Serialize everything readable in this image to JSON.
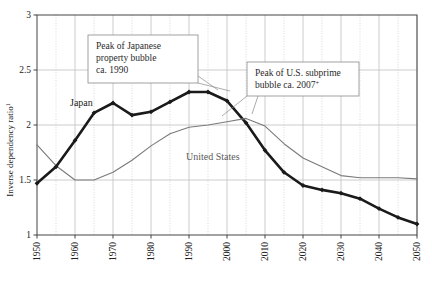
{
  "chart_data": {
    "type": "line",
    "title": "",
    "xlabel": "",
    "ylabel": "Inverse dependency ratio",
    "ylabel_superscript": "1",
    "xlim": [
      1950,
      2050
    ],
    "ylim": [
      1,
      3
    ],
    "grid": true,
    "legend_position": "inline-labels",
    "x_ticks": [
      1950,
      1960,
      1970,
      1980,
      1990,
      2000,
      2010,
      2020,
      2030,
      2040,
      2050
    ],
    "x_tick_labels": [
      "1950",
      "1960",
      "1970",
      "1980",
      "1990",
      "2000",
      "2010",
      "2020",
      "2030",
      "2040",
      "2050"
    ],
    "x_minor_ticks": [
      1955,
      1965,
      1975,
      1985,
      1995,
      2005,
      2015,
      2025,
      2035,
      2045
    ],
    "y_ticks": [
      1,
      1.5,
      2,
      2.5,
      3
    ],
    "y_tick_labels": [
      "1",
      "1.5",
      "2",
      "2.5",
      "3"
    ],
    "x": [
      1950,
      1955,
      1960,
      1965,
      1970,
      1975,
      1980,
      1985,
      1990,
      1995,
      2000,
      2005,
      2010,
      2015,
      2020,
      2025,
      2030,
      2035,
      2040,
      2045,
      2050
    ],
    "series": [
      {
        "name": "Japan",
        "color": "#1a1a1a",
        "width": 2.6,
        "markers": true,
        "values": [
          1.47,
          1.62,
          1.86,
          2.11,
          2.2,
          2.09,
          2.12,
          2.21,
          2.3,
          2.3,
          2.22,
          2.02,
          1.77,
          1.57,
          1.45,
          1.41,
          1.38,
          1.33,
          1.24,
          1.16,
          1.1
        ]
      },
      {
        "name": "United States",
        "color": "#7a7a7a",
        "width": 1.1,
        "markers": false,
        "values": [
          1.82,
          1.63,
          1.5,
          1.5,
          1.57,
          1.68,
          1.81,
          1.92,
          1.98,
          2.0,
          2.03,
          2.06,
          1.99,
          1.83,
          1.7,
          1.62,
          1.54,
          1.52,
          1.52,
          1.52,
          1.51
        ]
      }
    ],
    "annotations": [
      {
        "id": "japan-callout",
        "lines": [
          "Peak of Japanese",
          "property bubble",
          "ca. 1990"
        ],
        "points_to_x": 1990,
        "points_to_y": 2.3
      },
      {
        "id": "us-callout",
        "lines": [
          "Peak of U.S. subprime",
          "bubble ca. 2007"
        ],
        "superscript": "+",
        "points_to_x": 2007,
        "points_to_y": 2.05
      }
    ],
    "inline_labels": [
      {
        "text": "Japan",
        "series": "Japan"
      },
      {
        "text": "United States",
        "series": "United States"
      }
    ]
  },
  "colors": {
    "japan_line": "#1a1a1a",
    "us_line": "#7a7a7a",
    "grid": "#bfbfbf",
    "axis": "#444444",
    "callout_border": "#8a8a8a",
    "background": "#ffffff"
  }
}
